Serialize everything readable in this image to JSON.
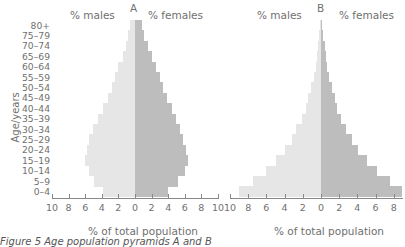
{
  "figure": {
    "caption": "Figure 5 Age population pyramids A and B",
    "y_axis_label": "Age/years"
  },
  "chart_data": [
    {
      "type": "bar",
      "orientation": "horizontal-pyramid",
      "title": "A",
      "left_header": "% males",
      "right_header": "% females",
      "xlabel": "% of total population",
      "ylabel": "Age/years",
      "xlim": [
        -10,
        10
      ],
      "x_ticks": [
        "10",
        "8",
        "6",
        "4",
        "2",
        "0",
        "2",
        "4",
        "6",
        "8",
        "10"
      ],
      "grid": false,
      "categories": [
        "80+",
        "75–79",
        "70–74",
        "65–69",
        "60–64",
        "55–59",
        "50–54",
        "45–49",
        "40–44",
        "35–39",
        "30–34",
        "25–29",
        "20–24",
        "15–19",
        "10–14",
        "5–9",
        "0–4"
      ],
      "series": [
        {
          "name": "% males",
          "values": [
            0.6,
            0.8,
            1.1,
            1.5,
            2.0,
            2.4,
            2.8,
            3.3,
            3.9,
            4.5,
            5.1,
            5.6,
            5.8,
            6.0,
            5.6,
            4.9,
            3.9
          ]
        },
        {
          "name": "% females",
          "values": [
            0.8,
            1.1,
            1.6,
            2.1,
            2.5,
            3.0,
            3.4,
            3.9,
            4.4,
            4.9,
            5.4,
            5.8,
            6.2,
            6.4,
            6.0,
            5.2,
            4.0
          ]
        }
      ]
    },
    {
      "type": "bar",
      "orientation": "horizontal-pyramid",
      "title": "B",
      "left_header": "% males",
      "right_header": "% females",
      "xlabel": "% of total population",
      "ylabel": "Age/years",
      "xlim": [
        -10,
        9
      ],
      "x_ticks": [
        "10",
        "8",
        "6",
        "4",
        "2",
        "0",
        "2",
        "4",
        "6",
        "8"
      ],
      "grid": false,
      "categories": [
        "80+",
        "75–79",
        "70–74",
        "65–69",
        "60–64",
        "55–59",
        "50–54",
        "45–49",
        "40–44",
        "35–39",
        "30–34",
        "25–29",
        "20–24",
        "15–19",
        "10–14",
        "5–9",
        "0–4"
      ],
      "series": [
        {
          "name": "% males",
          "values": [
            0.1,
            0.2,
            0.3,
            0.4,
            0.6,
            0.8,
            1.1,
            1.4,
            1.7,
            2.1,
            2.7,
            3.2,
            4.0,
            5.0,
            6.0,
            7.5,
            9.0
          ]
        },
        {
          "name": "% females",
          "values": [
            0.1,
            0.2,
            0.4,
            0.5,
            0.7,
            0.9,
            1.2,
            1.5,
            1.8,
            2.2,
            2.8,
            3.4,
            4.1,
            5.1,
            6.1,
            7.6,
            8.9
          ]
        }
      ]
    }
  ]
}
